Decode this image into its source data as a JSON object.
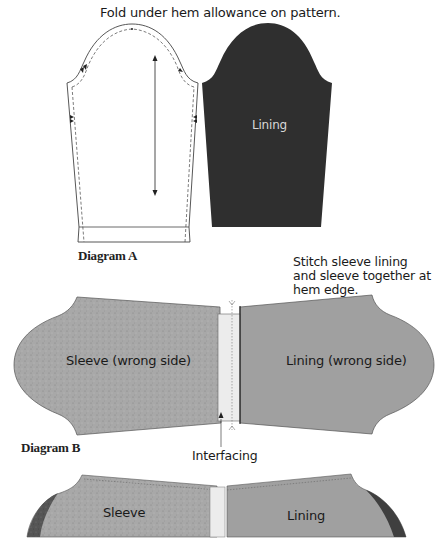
{
  "diagram_a": {
    "caption": "Fold under hem allowance on pattern.",
    "lining_label": "Lining",
    "title": "Diagram A"
  },
  "diagram_b": {
    "note": "Stitch sleeve lining and sleeve together at hem edge.",
    "sleeve_label": "Sleeve (wrong side)",
    "lining_label": "Lining (wrong side)",
    "title": "Diagram B",
    "interfacing_label": "Interfacing"
  },
  "diagram_c": {
    "sleeve_label": "Sleeve",
    "lining_label": "Lining"
  },
  "colors": {
    "pattern_outline": "#333333",
    "lining_dark": "#2e2e2e",
    "sleeve_speckled": "#a9a9a9",
    "lining_gray": "#9e9e9e",
    "interfacing": "#ececec",
    "seam_dark": "#555555"
  }
}
